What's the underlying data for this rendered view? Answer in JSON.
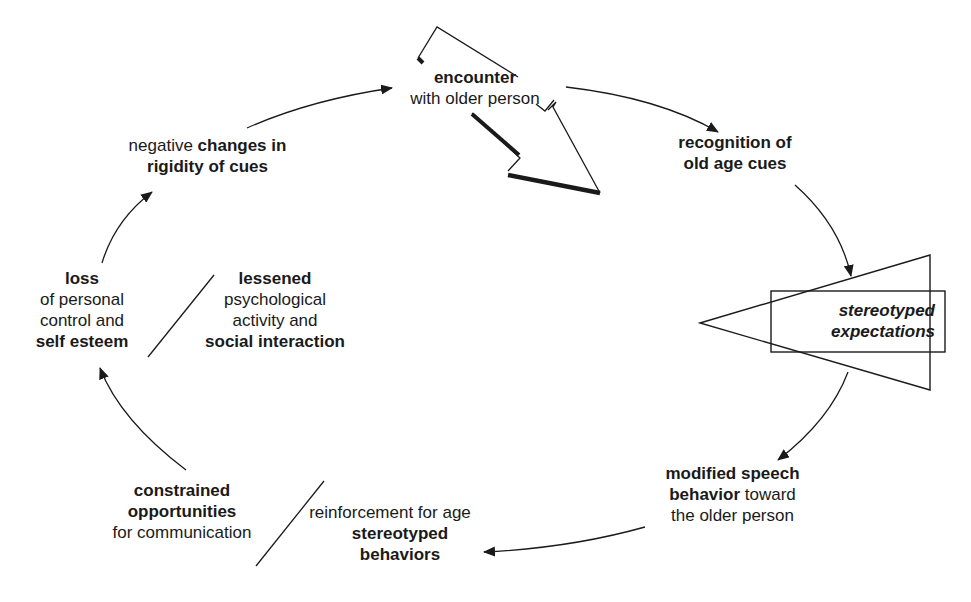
{
  "diagram": {
    "type": "cycle",
    "nodes": [
      {
        "id": "encounter",
        "lines": [
          {
            "bold": "encounter"
          },
          {
            "normal": "with older person"
          }
        ]
      },
      {
        "id": "recognition",
        "lines": [
          {
            "bold": "recognition of"
          },
          {
            "bold": "old age cues"
          }
        ]
      },
      {
        "id": "stereotyped-expectations",
        "lines": [
          {
            "bold_italic": "stereotyped"
          },
          {
            "bold_italic": "expectations"
          }
        ]
      },
      {
        "id": "modified-speech",
        "lines": [
          {
            "bold": "modified speech"
          },
          {
            "bold": "behavior",
            "normal": " toward"
          },
          {
            "normal": "the older person"
          }
        ]
      },
      {
        "id": "reinforcement",
        "lines": [
          {
            "normal": "reinforcement for age"
          },
          {
            "bold": "stereotyped"
          },
          {
            "bold": "behaviors"
          }
        ]
      },
      {
        "id": "constrained",
        "lines": [
          {
            "bold": "constrained"
          },
          {
            "bold": "opportunities"
          },
          {
            "normal": "for communication"
          }
        ]
      },
      {
        "id": "lessened",
        "lines": [
          {
            "bold": "lessened"
          },
          {
            "normal": "psychological"
          },
          {
            "normal": "activity and"
          },
          {
            "bold": "social interaction"
          }
        ]
      },
      {
        "id": "loss",
        "lines": [
          {
            "bold": "loss"
          },
          {
            "normal": "of personal"
          },
          {
            "normal": "control and"
          },
          {
            "bold": "self esteem"
          }
        ]
      },
      {
        "id": "negative-changes",
        "lines": [
          {
            "normal": "negative ",
            "bold": "changes in"
          },
          {
            "bold": "rigidity of cues"
          }
        ]
      }
    ],
    "edges": [
      [
        "encounter",
        "recognition"
      ],
      [
        "recognition",
        "stereotyped-expectations"
      ],
      [
        "stereotyped-expectations",
        "modified-speech"
      ],
      [
        "modified-speech",
        "reinforcement"
      ],
      [
        "constrained",
        "loss"
      ],
      [
        "loss",
        "negative-changes"
      ],
      [
        "negative-changes",
        "encounter"
      ]
    ]
  },
  "labels": {
    "encounter_l1": "encounter",
    "encounter_l2": "with older person",
    "recognition_l1": "recognition of",
    "recognition_l2": "old age cues",
    "stereo_l1": "stereotyped",
    "stereo_l2": "expectations",
    "modified_l1": "modified speech",
    "modified_l2_bold": "behavior",
    "modified_l2_normal": " toward",
    "modified_l3": "the older person",
    "reinf_l1": "reinforcement for age",
    "reinf_l2": "stereotyped",
    "reinf_l3": "behaviors",
    "constrained_l1": "constrained",
    "constrained_l2": "opportunities",
    "constrained_l3": "for communication",
    "lessened_l1": "lessened",
    "lessened_l2": "psychological",
    "lessened_l3": "activity and",
    "lessened_l4": "social interaction",
    "loss_l1": "loss",
    "loss_l2": "of personal",
    "loss_l3": "control and",
    "loss_l4": "self esteem",
    "negative_l1_normal": "negative ",
    "negative_l1_bold": "changes in",
    "negative_l2": "rigidity of cues"
  },
  "colors": {
    "ink": "#1a1a1a",
    "background": "#ffffff"
  }
}
